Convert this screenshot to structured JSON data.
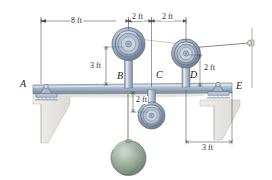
{
  "figure": {
    "background": "#ffffff",
    "colors": {
      "steel_light": "#c3ccd8",
      "steel_mid": "#9fafc1",
      "steel_dark": "#6b7d92",
      "steel_edge": "#5c6a7c",
      "pulley_ring": "#8fa0b4",
      "pulley_dark": "#55647a",
      "sphere_light": "#b9c6bb",
      "sphere_mid": "#93a596",
      "sphere_dark": "#6d7e70",
      "wall_fill": "#f2f1ee",
      "wall_edge": "#b9b7b2",
      "cable": "#8d8a82",
      "dimension_line": "#4a4a4a",
      "shadow": "#d8d6d1"
    }
  },
  "labels": {
    "point_a": "A",
    "point_b": "B",
    "point_c": "C",
    "point_d": "D",
    "point_e": "E"
  },
  "dimensions": {
    "span_ab": "8 ft",
    "span_bc": "2 ft",
    "span_cd": "2 ft",
    "height_b": "3 ft",
    "height_d": "2 ft",
    "depth_c": "2 ft",
    "span_de": "3 ft"
  },
  "elements": {
    "beam": "horizontal-beam",
    "support_a": "pin-support",
    "support_e": "pin-support",
    "pulley_b": "upper-pulley-b",
    "pulley_c": "lower-pulley-c",
    "pulley_d": "upper-pulley-d",
    "sphere": "suspended-sphere-weight",
    "anchor": "wall-cable-anchor",
    "cable": "cable-line"
  }
}
